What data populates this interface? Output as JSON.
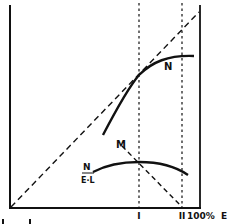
{
  "diagram": {
    "curve_labels": {
      "N": "N",
      "M": "M",
      "ratio_numerator": "N",
      "ratio_denominator": "E·L"
    },
    "x_axis": {
      "ticks": [
        "I",
        "II",
        "100%"
      ],
      "label": "E"
    },
    "colors": {
      "ink": "#111111",
      "background": "#ffffff"
    }
  }
}
